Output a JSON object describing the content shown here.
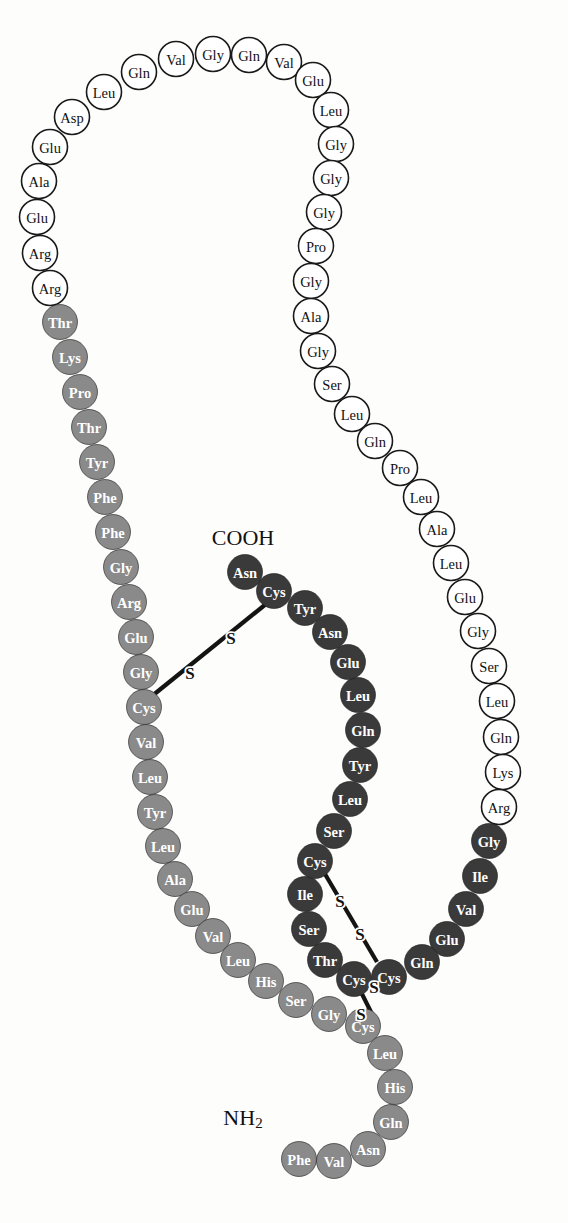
{
  "figure": {
    "background_color": "#fdfdfc"
  },
  "terminals": [
    {
      "id": "cooh",
      "label": "COOH",
      "sub": "",
      "x": 243,
      "y": 537
    },
    {
      "id": "nh2",
      "label": "NH",
      "sub": "2",
      "x": 243,
      "y": 1117
    }
  ],
  "styles": {
    "white_fill": "#ffffff",
    "white_text": "#111111",
    "white_stroke": "#1a1a1a",
    "white_stroke_width": 1.6,
    "mid_fill": "#8a8a8a",
    "mid_text": "#ffffff",
    "mid_stroke": "#8a8a8a",
    "mid_stroke_width": 0.6,
    "dark_fill": "#3a3a3a",
    "dark_text": "#ffffff",
    "dark_stroke": "#3a3a3a",
    "dark_stroke_width": 0.6,
    "radius": 17.5,
    "bond_color": "#141414"
  },
  "chains": [
    {
      "name": "c-peptide-left",
      "style": "white",
      "residues": [
        {
          "label": "Arg",
          "x": 50,
          "y": 288
        },
        {
          "label": "Arg",
          "x": 40,
          "y": 253
        },
        {
          "label": "Glu",
          "x": 37,
          "y": 217
        },
        {
          "label": "Ala",
          "x": 39,
          "y": 181
        },
        {
          "label": "Glu",
          "x": 50,
          "y": 147
        },
        {
          "label": "Asp",
          "x": 72,
          "y": 117
        },
        {
          "label": "Leu",
          "x": 104,
          "y": 92
        },
        {
          "label": "Gln",
          "x": 139,
          "y": 72
        },
        {
          "label": "Val",
          "x": 176,
          "y": 59
        },
        {
          "label": "Gly",
          "x": 213,
          "y": 54
        },
        {
          "label": "Gln",
          "x": 249,
          "y": 55
        },
        {
          "label": "Val",
          "x": 284,
          "y": 62
        },
        {
          "label": "Glu",
          "x": 313,
          "y": 80
        },
        {
          "label": "Leu",
          "x": 331,
          "y": 110
        },
        {
          "label": "Gly",
          "x": 336,
          "y": 144
        },
        {
          "label": "Gly",
          "x": 331,
          "y": 178
        },
        {
          "label": "Gly",
          "x": 324,
          "y": 212
        },
        {
          "label": "Pro",
          "x": 316,
          "y": 246
        },
        {
          "label": "Gly",
          "x": 311,
          "y": 281
        },
        {
          "label": "Ala",
          "x": 311,
          "y": 316
        },
        {
          "label": "Gly",
          "x": 318,
          "y": 351
        },
        {
          "label": "Ser",
          "x": 332,
          "y": 384
        },
        {
          "label": "Leu",
          "x": 352,
          "y": 414
        },
        {
          "label": "Gln",
          "x": 375,
          "y": 441
        },
        {
          "label": "Pro",
          "x": 400,
          "y": 468
        },
        {
          "label": "Leu",
          "x": 421,
          "y": 497
        },
        {
          "label": "Ala",
          "x": 437,
          "y": 529
        },
        {
          "label": "Leu",
          "x": 451,
          "y": 563
        },
        {
          "label": "Glu",
          "x": 465,
          "y": 597
        },
        {
          "label": "Gly",
          "x": 478,
          "y": 631
        },
        {
          "label": "Ser",
          "x": 489,
          "y": 666
        },
        {
          "label": "Leu",
          "x": 497,
          "y": 701
        },
        {
          "label": "Gln",
          "x": 501,
          "y": 737
        },
        {
          "label": "Lys",
          "x": 503,
          "y": 772
        },
        {
          "label": "Arg",
          "x": 499,
          "y": 807
        }
      ]
    },
    {
      "name": "b-chain",
      "style": "mid",
      "residues": [
        {
          "label": "Thr",
          "x": 60,
          "y": 322
        },
        {
          "label": "Lys",
          "x": 70,
          "y": 357
        },
        {
          "label": "Pro",
          "x": 80,
          "y": 392
        },
        {
          "label": "Thr",
          "x": 89,
          "y": 427
        },
        {
          "label": "Tyr",
          "x": 97,
          "y": 462
        },
        {
          "label": "Phe",
          "x": 105,
          "y": 497
        },
        {
          "label": "Phe",
          "x": 113,
          "y": 532
        },
        {
          "label": "Gly",
          "x": 121,
          "y": 567
        },
        {
          "label": "Arg",
          "x": 129,
          "y": 602
        },
        {
          "label": "Glu",
          "x": 136,
          "y": 637
        },
        {
          "label": "Gly",
          "x": 141,
          "y": 672
        },
        {
          "label": "Cys",
          "x": 144,
          "y": 707
        },
        {
          "label": "Val",
          "x": 146,
          "y": 742
        },
        {
          "label": "Leu",
          "x": 150,
          "y": 777
        },
        {
          "label": "Tyr",
          "x": 155,
          "y": 812
        },
        {
          "label": "Leu",
          "x": 163,
          "y": 846
        },
        {
          "label": "Ala",
          "x": 175,
          "y": 879
        },
        {
          "label": "Glu",
          "x": 192,
          "y": 909
        },
        {
          "label": "Val",
          "x": 213,
          "y": 936
        },
        {
          "label": "Leu",
          "x": 238,
          "y": 960
        },
        {
          "label": "His",
          "x": 266,
          "y": 981
        },
        {
          "label": "Ser",
          "x": 296,
          "y": 1000
        },
        {
          "label": "Gly",
          "x": 329,
          "y": 1014
        },
        {
          "label": "Cys",
          "x": 363,
          "y": 1026
        },
        {
          "label": "Leu",
          "x": 385,
          "y": 1053
        },
        {
          "label": "His",
          "x": 395,
          "y": 1087
        },
        {
          "label": "Gln",
          "x": 391,
          "y": 1122
        },
        {
          "label": "Asn",
          "x": 368,
          "y": 1149
        },
        {
          "label": "Val",
          "x": 334,
          "y": 1161
        },
        {
          "label": "Phe",
          "x": 299,
          "y": 1159
        }
      ]
    },
    {
      "name": "a-chain",
      "style": "dark",
      "residues": [
        {
          "label": "Gly",
          "x": 489,
          "y": 841
        },
        {
          "label": "Ile",
          "x": 480,
          "y": 876
        },
        {
          "label": "Val",
          "x": 466,
          "y": 909
        },
        {
          "label": "Glu",
          "x": 447,
          "y": 939
        },
        {
          "label": "Gln",
          "x": 422,
          "y": 962
        },
        {
          "label": "Cys",
          "x": 389,
          "y": 977
        },
        {
          "label": "Cys",
          "x": 354,
          "y": 979
        },
        {
          "label": "Thr",
          "x": 325,
          "y": 960
        },
        {
          "label": "Ser",
          "x": 309,
          "y": 929
        },
        {
          "label": "Ile",
          "x": 305,
          "y": 894
        },
        {
          "label": "Cys",
          "x": 315,
          "y": 861
        },
        {
          "label": "Ser",
          "x": 334,
          "y": 831
        },
        {
          "label": "Leu",
          "x": 350,
          "y": 799
        },
        {
          "label": "Tyr",
          "x": 360,
          "y": 765
        },
        {
          "label": "Gln",
          "x": 363,
          "y": 730
        },
        {
          "label": "Leu",
          "x": 358,
          "y": 695
        },
        {
          "label": "Glu",
          "x": 348,
          "y": 662
        },
        {
          "label": "Asn",
          "x": 330,
          "y": 632
        },
        {
          "label": "Tyr",
          "x": 305,
          "y": 608
        },
        {
          "label": "Cys",
          "x": 274,
          "y": 591
        },
        {
          "label": "Asn",
          "x": 245,
          "y": 572
        }
      ]
    }
  ],
  "disulfide_bonds": [
    {
      "name": "ss-b7-a7",
      "from": {
        "x": 152,
        "y": 696
      },
      "to": {
        "x": 266,
        "y": 604
      },
      "sulfurs": [
        {
          "label": "S",
          "x": 190,
          "y": 673
        },
        {
          "label": "S",
          "x": 231,
          "y": 638
        }
      ]
    },
    {
      "name": "ss-a6-a11",
      "from": {
        "x": 322,
        "y": 869
      },
      "to": {
        "x": 377,
        "y": 962
      },
      "sulfurs": [
        {
          "label": "S",
          "x": 340,
          "y": 901
        },
        {
          "label": "S",
          "x": 360,
          "y": 934
        }
      ]
    },
    {
      "name": "ss-b19-a20",
      "from": {
        "x": 362,
        "y": 994
      },
      "to": {
        "x": 371,
        "y": 1012
      },
      "sulfurs": [
        {
          "label": "S",
          "x": 374,
          "y": 987
        },
        {
          "label": "S",
          "x": 361,
          "y": 1014
        }
      ]
    }
  ],
  "legend": {
    "white_chain_name": "C-peptide (connecting peptide)",
    "mid_chain_name": "B chain",
    "dark_chain_name": "A chain"
  }
}
